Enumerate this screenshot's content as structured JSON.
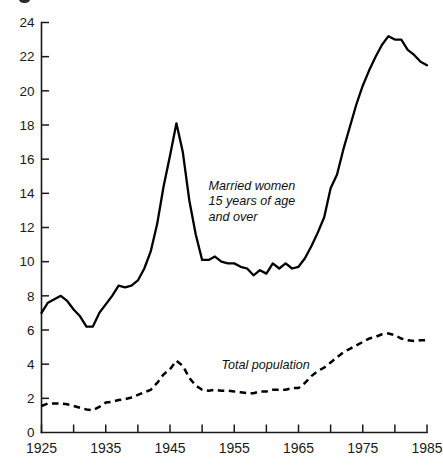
{
  "figure": {
    "caption_fragment": "",
    "background": "#ffffff",
    "ink_color": "#000000"
  },
  "chart_data": {
    "type": "line",
    "title": "",
    "subtitle": "",
    "xlabel": "",
    "ylabel": "",
    "xlim": [
      1925,
      1985
    ],
    "ylim": [
      0,
      24
    ],
    "grid": false,
    "legend": "inline-annotations",
    "x_tick_labels": [
      "1925",
      "1935",
      "1945",
      "1955",
      "1965",
      "1975",
      "1985"
    ],
    "x_minor_ticks": [
      1930,
      1940,
      1950,
      1960,
      1970,
      1980
    ],
    "y_tick_labels": [
      "0",
      "2",
      "4",
      "6",
      "8",
      "10",
      "12",
      "14",
      "16",
      "18",
      "20",
      "22",
      "24"
    ],
    "y_ticks": [
      0,
      2,
      4,
      6,
      8,
      10,
      12,
      14,
      16,
      18,
      20,
      22,
      24
    ],
    "annotations": [
      {
        "name": "married-women-label",
        "lines": [
          "Married women",
          "15 years of age",
          "and over"
        ],
        "x": 1951,
        "y": 14.2,
        "style": "italic"
      },
      {
        "name": "total-population-label",
        "lines": [
          "Total population"
        ],
        "x": 1953,
        "y": 3.7,
        "style": "italic"
      }
    ],
    "series": [
      {
        "name": "Married women 15 years of age and over",
        "style": "solid",
        "color": "#000000",
        "x": [
          1925,
          1926,
          1927,
          1928,
          1929,
          1930,
          1931,
          1932,
          1933,
          1934,
          1935,
          1936,
          1937,
          1938,
          1939,
          1940,
          1941,
          1942,
          1943,
          1944,
          1945,
          1946,
          1947,
          1948,
          1949,
          1950,
          1951,
          1952,
          1953,
          1954,
          1955,
          1956,
          1957,
          1958,
          1959,
          1960,
          1961,
          1962,
          1963,
          1964,
          1965,
          1966,
          1967,
          1968,
          1969,
          1970,
          1971,
          1972,
          1973,
          1974,
          1975,
          1976,
          1977,
          1978,
          1979,
          1980,
          1981,
          1982,
          1983,
          1984,
          1985
        ],
        "values": [
          7.0,
          7.6,
          7.8,
          8.0,
          7.7,
          7.2,
          6.8,
          6.2,
          6.2,
          7.0,
          7.5,
          8.0,
          8.6,
          8.5,
          8.6,
          8.9,
          9.6,
          10.6,
          12.2,
          14.4,
          16.2,
          18.1,
          16.4,
          13.6,
          11.6,
          10.1,
          10.1,
          10.3,
          10.0,
          9.9,
          9.9,
          9.7,
          9.6,
          9.2,
          9.5,
          9.3,
          9.9,
          9.6,
          9.9,
          9.6,
          9.7,
          10.2,
          10.9,
          11.7,
          12.6,
          14.3,
          15.1,
          16.6,
          17.9,
          19.2,
          20.3,
          21.2,
          22.0,
          22.7,
          23.2,
          23.0,
          23.0,
          22.4,
          22.1,
          21.7,
          21.5
        ]
      },
      {
        "name": "Total population",
        "style": "dashed",
        "color": "#000000",
        "x": [
          1925,
          1926,
          1927,
          1928,
          1929,
          1930,
          1931,
          1932,
          1933,
          1934,
          1935,
          1936,
          1937,
          1938,
          1939,
          1940,
          1941,
          1942,
          1943,
          1944,
          1945,
          1946,
          1947,
          1948,
          1949,
          1950,
          1951,
          1952,
          1953,
          1954,
          1955,
          1956,
          1957,
          1958,
          1959,
          1960,
          1961,
          1962,
          1963,
          1964,
          1965,
          1966,
          1967,
          1968,
          1969,
          1970,
          1971,
          1972,
          1973,
          1974,
          1975,
          1976,
          1977,
          1978,
          1979,
          1980,
          1981,
          1982,
          1983,
          1984,
          1985
        ],
        "values": [
          1.55,
          1.7,
          1.7,
          1.7,
          1.65,
          1.55,
          1.45,
          1.35,
          1.3,
          1.5,
          1.75,
          1.8,
          1.9,
          1.95,
          2.05,
          2.2,
          2.35,
          2.5,
          2.9,
          3.4,
          3.7,
          4.2,
          3.9,
          3.2,
          2.75,
          2.5,
          2.45,
          2.5,
          2.45,
          2.45,
          2.4,
          2.35,
          2.3,
          2.3,
          2.4,
          2.4,
          2.5,
          2.5,
          2.5,
          2.6,
          2.6,
          2.9,
          3.3,
          3.6,
          3.8,
          4.1,
          4.4,
          4.7,
          4.9,
          5.1,
          5.3,
          5.5,
          5.6,
          5.75,
          5.8,
          5.7,
          5.5,
          5.4,
          5.35,
          5.4,
          5.4
        ]
      }
    ]
  }
}
